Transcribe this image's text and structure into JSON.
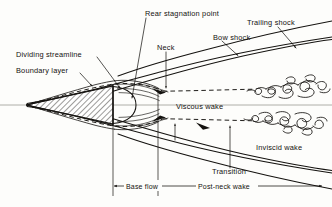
{
  "figure": {
    "background_color": "#fdfdfb",
    "ink_color": "#14120f",
    "axis_color": "#9a9a94"
  },
  "labels": {
    "rear_stagnation_point": "Rear stagnation point",
    "bow_shock": "Bow shock",
    "trailing_shock": "Trailing shock",
    "neck": "Neck",
    "dividing_streamline": "Dividing streamline",
    "boundary_layer": "Boundary layer",
    "viscous_wake": "Viscous wake",
    "inviscid_wake": "Inviscid wake",
    "transition": "Transition",
    "base_flow": "Base flow",
    "post_neck_wake": "Post-neck wake"
  },
  "dimensions": [
    {
      "name": "base-flow",
      "label": "Base flow",
      "from_x": 113,
      "to_x": 158
    },
    {
      "name": "post-neck-wake",
      "label": "Post-neck wake",
      "from_x": 158,
      "to_x": 322
    }
  ],
  "annotations": [
    {
      "name": "rear-stagnation-point",
      "text": "Rear stagnation point",
      "x": 145,
      "y": 13,
      "anchor": "start"
    },
    {
      "name": "bow-shock",
      "text": "Bow shock",
      "x": 213,
      "y": 38,
      "anchor": "start"
    },
    {
      "name": "trailing-shock",
      "text": "Trailing shock",
      "x": 247,
      "y": 23,
      "anchor": "start"
    },
    {
      "name": "neck",
      "text": "Neck",
      "x": 158,
      "y": 48,
      "anchor": "start"
    },
    {
      "name": "dividing-streamline",
      "text": "Dividing streamline",
      "x": 17,
      "y": 55,
      "anchor": "start"
    },
    {
      "name": "boundary-layer",
      "text": "Boundary layer",
      "x": 17,
      "y": 71,
      "anchor": "start"
    },
    {
      "name": "viscous-wake",
      "text": "Viscous wake",
      "x": 176,
      "y": 107,
      "anchor": "start"
    },
    {
      "name": "inviscid-wake",
      "text": "Inviscid wake",
      "x": 256,
      "y": 148,
      "anchor": "start"
    },
    {
      "name": "transition",
      "text": "Transition",
      "x": 212,
      "y": 172,
      "anchor": "start"
    }
  ],
  "geometry": {
    "centerline_y": 105,
    "nose_tip_x": 25,
    "base_x": 113,
    "neck_x": 158,
    "body_half_height": 19
  }
}
